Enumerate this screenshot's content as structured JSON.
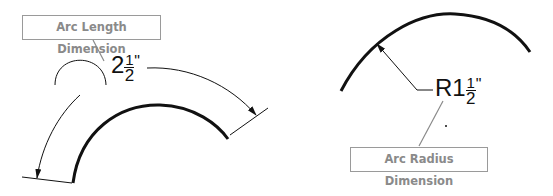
{
  "diagram": {
    "left": {
      "callout_label": "Arc Length Dimension",
      "dimension": {
        "whole": "2",
        "numerator": "1",
        "denominator": "2",
        "unit": "\""
      },
      "symbol": "arc-length-symbol"
    },
    "right": {
      "callout_label": "Arc Radius Dimension",
      "dimension": {
        "prefix": "R1",
        "numerator": "1",
        "denominator": "2",
        "unit": "\""
      }
    },
    "colors": {
      "line": "#111111",
      "callout_border": "#9a9a9a",
      "callout_text": "#8a8a8a",
      "leader": "#8a8a8a"
    }
  }
}
